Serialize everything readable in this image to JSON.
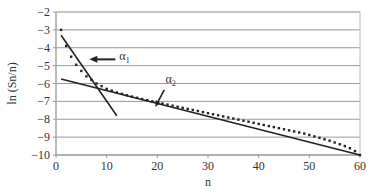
{
  "chart_data": {
    "type": "line",
    "title": "",
    "xlabel": "n",
    "ylabel": "ln (Sn/n)",
    "xlim": [
      0,
      60
    ],
    "ylim": [
      -10,
      -2
    ],
    "x_ticks": [
      0,
      10,
      20,
      30,
      40,
      50,
      60
    ],
    "y_ticks": [
      -2,
      -3,
      -4,
      -5,
      -6,
      -7,
      -8,
      -9,
      -10
    ],
    "grid": "horizontal",
    "legend": null,
    "series": [
      {
        "name": "data",
        "style": "dotted-markers",
        "x": [
          1,
          2,
          3,
          4,
          5,
          6,
          7,
          8,
          9,
          10,
          11,
          12,
          13,
          14,
          15,
          16,
          17,
          18,
          19,
          20,
          21,
          22,
          23,
          24,
          25,
          26,
          27,
          28,
          29,
          30,
          31,
          32,
          33,
          34,
          35,
          36,
          37,
          38,
          39,
          40,
          41,
          42,
          43,
          44,
          45,
          46,
          47,
          48,
          49,
          50,
          51,
          52,
          53,
          54,
          55,
          56,
          57,
          58,
          59,
          60
        ],
        "values": [
          -3.0,
          -3.9,
          -4.5,
          -4.95,
          -5.3,
          -5.6,
          -5.8,
          -6.0,
          -6.15,
          -6.3,
          -6.4,
          -6.5,
          -6.58,
          -6.66,
          -6.73,
          -6.8,
          -6.87,
          -6.93,
          -7.0,
          -7.06,
          -7.12,
          -7.18,
          -7.24,
          -7.3,
          -7.36,
          -7.42,
          -7.48,
          -7.54,
          -7.6,
          -7.66,
          -7.72,
          -7.78,
          -7.84,
          -7.9,
          -7.96,
          -8.02,
          -8.08,
          -8.14,
          -8.2,
          -8.26,
          -8.32,
          -8.38,
          -8.44,
          -8.5,
          -8.56,
          -8.62,
          -8.68,
          -8.74,
          -8.8,
          -8.88,
          -8.96,
          -9.04,
          -9.12,
          -9.2,
          -9.3,
          -9.4,
          -9.5,
          -9.62,
          -9.78,
          -10.0
        ]
      },
      {
        "name": "α1",
        "style": "solid-line",
        "x": [
          1,
          12
        ],
        "values": [
          -3.3,
          -7.8
        ]
      },
      {
        "name": "α2",
        "style": "solid-line",
        "x": [
          1,
          60
        ],
        "values": [
          -5.75,
          -10.0
        ]
      }
    ],
    "annotations": [
      {
        "label": "α",
        "subscript": "1",
        "arrow_to": [
          5,
          -4.65
        ],
        "text_pos": [
          12.5,
          -4.6
        ]
      },
      {
        "label": "α",
        "subscript": "2",
        "arrow_to": [
          20,
          -7.2
        ],
        "text_pos": [
          21,
          -6.1
        ]
      }
    ]
  },
  "axes": {
    "xlabel": "n",
    "ylabel": "ln (Sn/n)",
    "x_tick_labels": [
      "0",
      "10",
      "20",
      "30",
      "40",
      "50",
      "60"
    ],
    "y_tick_labels": [
      "−2",
      "−3",
      "−4",
      "−5",
      "−6",
      "−7",
      "−8",
      "−9",
      "−10"
    ]
  },
  "annotations": {
    "a1_symbol": "α",
    "a1_sub": "1",
    "a2_symbol": "α",
    "a2_sub": "2"
  }
}
